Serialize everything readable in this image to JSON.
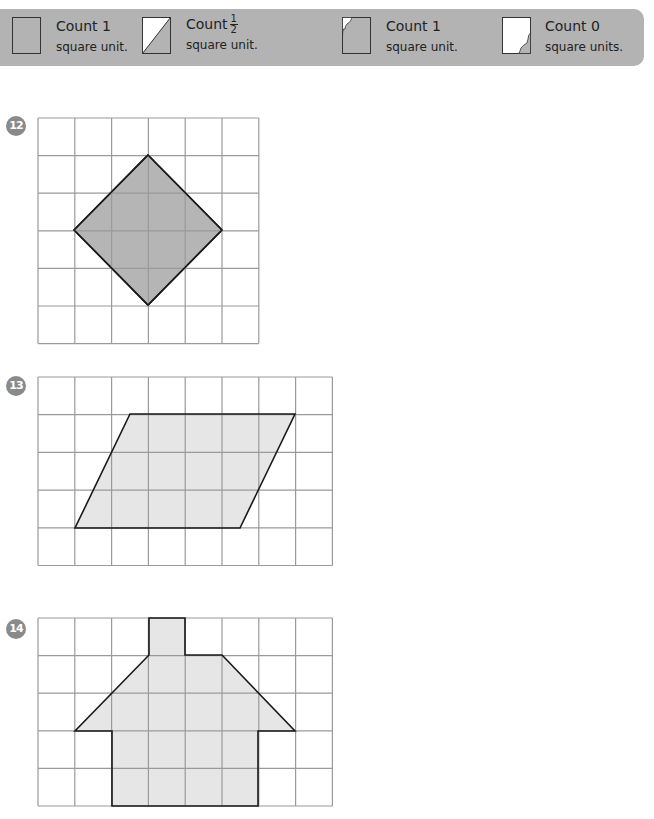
{
  "legend": {
    "items": [
      {
        "icon": "full-square-icon",
        "count_label": "Count 1",
        "unit_label": "square unit."
      },
      {
        "icon": "half-square-icon",
        "count_label": "Count",
        "fraction_num": "1",
        "fraction_den": "2",
        "unit_label": "square unit."
      },
      {
        "icon": "mostly-filled-square-icon",
        "count_label": "Count 1",
        "unit_label": "square unit."
      },
      {
        "icon": "small-sliver-square-icon",
        "count_label": "Count 0",
        "unit_label": "square units."
      }
    ],
    "colors": {
      "band": "#b3b3b3",
      "fill": "#b3b3b3",
      "empty": "#ffffff"
    }
  },
  "problems": [
    {
      "number": "12",
      "shape": "diamond",
      "grid": {
        "cols": 6,
        "rows": 6
      },
      "fill_color": "#b5b5b5",
      "vertices": [
        [
          3,
          1
        ],
        [
          5,
          3
        ],
        [
          3,
          5
        ],
        [
          1,
          3
        ]
      ]
    },
    {
      "number": "13",
      "shape": "parallelogram",
      "grid": {
        "cols": 8,
        "rows": 5
      },
      "fill_color": "#e6e6e6",
      "vertices": [
        [
          2.5,
          1
        ],
        [
          7,
          1
        ],
        [
          5.5,
          4
        ],
        [
          1,
          4
        ]
      ]
    },
    {
      "number": "14",
      "shape": "house",
      "grid": {
        "cols": 8,
        "rows": 5
      },
      "fill_color": "#e6e6e6",
      "vertices": [
        [
          3,
          0
        ],
        [
          4,
          0
        ],
        [
          4,
          1
        ],
        [
          5,
          1
        ],
        [
          7,
          3
        ],
        [
          6,
          3
        ],
        [
          6,
          5
        ],
        [
          2,
          5
        ],
        [
          2,
          3
        ],
        [
          1,
          3
        ],
        [
          3,
          1
        ]
      ]
    }
  ],
  "colors": {
    "grid_line": "#9a9a9a",
    "outline": "#1a1a1a",
    "badge": "#8a8a8a"
  }
}
